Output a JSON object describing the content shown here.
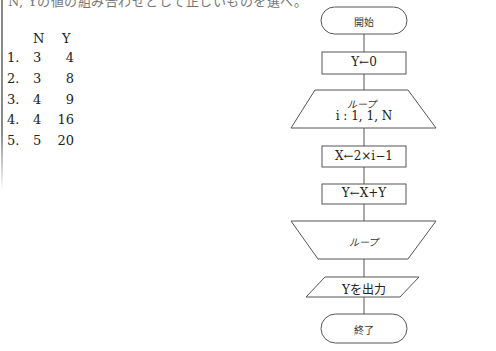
{
  "question": {
    "clipped_top_text": "N, Yの値の組み合わせとして正しいものを選べ。"
  },
  "choices_table": {
    "headers": {
      "n": "N",
      "y": "Y"
    },
    "rows": [
      {
        "num": "1.",
        "n": "3",
        "y": "4"
      },
      {
        "num": "2.",
        "n": "3",
        "y": "8"
      },
      {
        "num": "3.",
        "n": "4",
        "y": "9"
      },
      {
        "num": "4.",
        "n": "4",
        "y": "16"
      },
      {
        "num": "5.",
        "n": "5",
        "y": "20"
      }
    ]
  },
  "flowchart": {
    "start": "開始",
    "init": "Y←0",
    "loop_start": {
      "title": "ループ",
      "condition": "i : 1,  1,  N"
    },
    "step1": "X←2×i−1",
    "step2": "Y←X+Y",
    "loop_end": "ループ",
    "output": "Yを出力",
    "end": "終了"
  }
}
